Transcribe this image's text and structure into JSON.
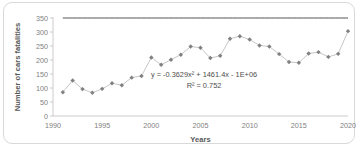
{
  "chart_data": {
    "type": "scatter",
    "title": "",
    "xlabel": "Years",
    "ylabel": "Number of cars fatalities",
    "xlim": [
      1990,
      2020
    ],
    "ylim": [
      0,
      350
    ],
    "xticks": [
      1990,
      1995,
      2000,
      2005,
      2010,
      2015,
      2020
    ],
    "yticks": [
      0,
      50,
      100,
      150,
      200,
      250,
      300,
      350
    ],
    "grid": false,
    "legend": "none",
    "marker": "diamond",
    "series": [
      {
        "name": "Number of cars fatalities",
        "x": [
          1991,
          1992,
          1993,
          1994,
          1995,
          1996,
          1997,
          1998,
          1999,
          2000,
          2001,
          2002,
          2003,
          2004,
          2005,
          2006,
          2007,
          2008,
          2009,
          2010,
          2011,
          2012,
          2013,
          2014,
          2015,
          2016,
          2017,
          2018,
          2019,
          2020
        ],
        "values": [
          85,
          127,
          96,
          83,
          97,
          117,
          110,
          137,
          143,
          209,
          183,
          201,
          219,
          248,
          244,
          207,
          215,
          276,
          285,
          273,
          252,
          248,
          221,
          193,
          190,
          223,
          228,
          211,
          222,
          303
        ]
      }
    ],
    "trendline": {
      "type": "polynomial-order-2",
      "equation": "y = -0.3629x² + 1461.4x - 1E+06",
      "r_squared_label": "R² = 0.752",
      "a": -0.3629,
      "b": 1461.4,
      "c": -1000000
    },
    "colors": {
      "marker": "#808080",
      "connector": "#bfbfbf",
      "trendline": "#404040",
      "axis": "#bfbfbf",
      "tick_label": "#808080",
      "border": "#d9d9d9"
    },
    "annotations": [
      {
        "name": "trendline-equation",
        "text": "y = -0.3629x² + 1461.4x - 1E+06"
      },
      {
        "name": "r-squared",
        "text": "R² = 0.752"
      }
    ]
  }
}
